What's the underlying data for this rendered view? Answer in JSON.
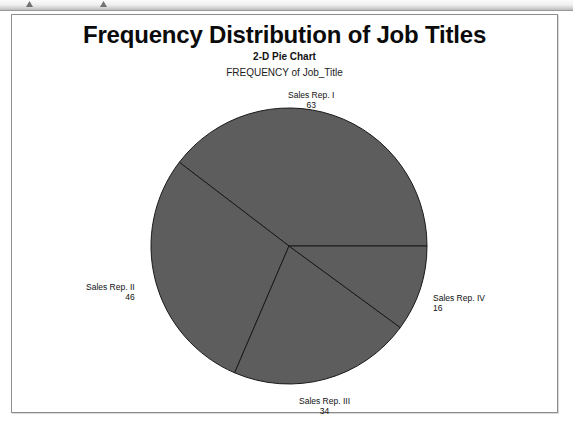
{
  "toolbar": {
    "glyph_a": "triangle-marker-icon",
    "glyph_b": "triangle-marker-icon"
  },
  "report": {
    "title": "Frequency Distribution of Job Titles",
    "subtitle": "2-D Pie Chart",
    "measure_label": "FREQUENCY of Job_Title"
  },
  "colors": {
    "slice_fill": "#5d5d5d",
    "slice_outline": "#1a1a1a",
    "frame_border": "#8d8d8d",
    "text": "#101010",
    "page_background": "#ffffff"
  },
  "chart_data": {
    "type": "pie",
    "title": "Frequency Distribution of Job Titles",
    "subtitle": "2-D Pie Chart",
    "measure_label": "FREQUENCY of Job_Title",
    "categories": [
      "Sales Rep. I",
      "Sales Rep. II",
      "Sales Rep. III",
      "Sales Rep. IV"
    ],
    "values": [
      63,
      46,
      34,
      16
    ],
    "total": 159,
    "percentages": [
      39.6,
      28.9,
      21.4,
      10.1
    ],
    "start_angle_deg": 0,
    "direction": "counterclockwise",
    "slice_angles_deg": [
      142.6,
      104.2,
      77.0,
      36.2
    ],
    "labels_show_value": true,
    "legend": "none",
    "grid": false,
    "xlabel": "",
    "ylabel": "",
    "slices": [
      {
        "name": "Sales Rep. I",
        "value": 63,
        "percent": 39.6
      },
      {
        "name": "Sales Rep. II",
        "value": 46,
        "percent": 28.9
      },
      {
        "name": "Sales Rep. III",
        "value": 34,
        "percent": 21.4
      },
      {
        "name": "Sales Rep. IV",
        "value": 16,
        "percent": 10.1
      }
    ]
  },
  "geometry": {
    "center_x": 277,
    "center_y": 231,
    "radius": 138
  }
}
